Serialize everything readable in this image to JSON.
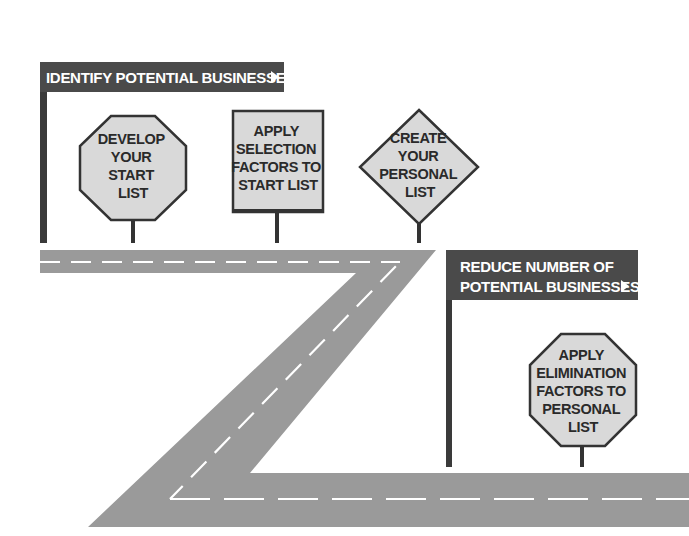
{
  "colors": {
    "road": "#9a9a9a",
    "lane_marking": "#ffffff",
    "banner_fill": "#4a4a4a",
    "post": "#333333",
    "sign_fill": "#d9d9d9",
    "sign_border": "#333333",
    "text_dark": "#2a2a2a",
    "text_light": "#ffffff"
  },
  "banners": [
    {
      "id": "identify",
      "lines": [
        "IDENTIFY POTENTIAL BUSINESSES"
      ],
      "arrow_icon": "triangle-right-icon"
    },
    {
      "id": "reduce",
      "lines": [
        "REDUCE NUMBER OF",
        "POTENTIAL BUSINESSES"
      ],
      "arrow_icon": "triangle-right-icon"
    }
  ],
  "signs": [
    {
      "id": "develop-start-list",
      "shape": "octagon",
      "lines": [
        "DEVELOP",
        "YOUR",
        "START",
        "LIST"
      ]
    },
    {
      "id": "apply-selection-factors",
      "shape": "square",
      "lines": [
        "APPLY",
        "SELECTION",
        "FACTORS TO",
        "START LIST"
      ]
    },
    {
      "id": "create-personal-list",
      "shape": "diamond",
      "lines": [
        "CREATE",
        "YOUR",
        "PERSONAL",
        "LIST"
      ]
    },
    {
      "id": "apply-elimination-factors",
      "shape": "octagon",
      "lines": [
        "APPLY",
        "ELIMINATION",
        "FACTORS TO",
        "PERSONAL",
        "LIST"
      ]
    }
  ]
}
